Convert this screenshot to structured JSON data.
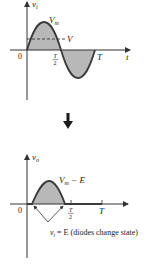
{
  "top_graph": {
    "y_axis_label": "v",
    "y_axis_sub": "i",
    "x_axis_label": "t",
    "peak_label": "V",
    "peak_sub": "m",
    "dashed_label": "V",
    "origin_label": "0",
    "half_period_num": "T",
    "half_period_den": "2",
    "period_label": "T"
  },
  "arrow": {
    "direction": "down"
  },
  "bottom_graph": {
    "y_axis_label": "v",
    "y_axis_sub": "o",
    "peak_label_v": "V",
    "peak_label_sub": "m",
    "peak_label_rest": " − E",
    "origin_label": "0",
    "half_period_num": "T",
    "half_period_den": "2",
    "period_label": "T",
    "annotation_v": "v",
    "annotation_sub": "i",
    "annotation_rest": " = E (diodes change state)"
  },
  "colors": {
    "wave": "#3a3a3a",
    "fill": "#b8b8b8",
    "axis": "#333333"
  }
}
